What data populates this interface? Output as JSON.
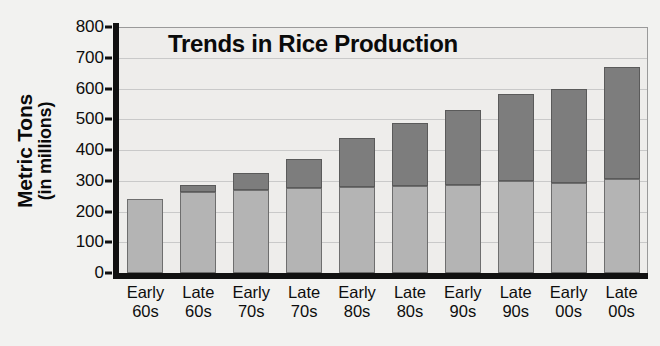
{
  "chart_data": {
    "type": "bar",
    "stacked": true,
    "title": "Trends in Rice Production",
    "xlabel": "",
    "ylabel": "Metric Tons (in millions)",
    "ylabel_line1": "Metric Tons",
    "ylabel_line2": "(in millions)",
    "ylim": [
      0,
      800
    ],
    "ytick_step": 100,
    "yticks": [
      800,
      700,
      600,
      500,
      400,
      300,
      200,
      100,
      0
    ],
    "grid": true,
    "legend": "none",
    "categories": [
      "Early 60s",
      "Late 60s",
      "Early 70s",
      "Late 70s",
      "Early 80s",
      "Late 80s",
      "Early 90s",
      "Late 90s",
      "Early 00s",
      "Late 00s"
    ],
    "category_lines": [
      [
        "Early",
        "60s"
      ],
      [
        "Late",
        "60s"
      ],
      [
        "Early",
        "70s"
      ],
      [
        "Late",
        "70s"
      ],
      [
        "Early",
        "80s"
      ],
      [
        "Late",
        "80s"
      ],
      [
        "Early",
        "90s"
      ],
      [
        "Late",
        "90s"
      ],
      [
        "Early",
        "00s"
      ],
      [
        "Late",
        "00s"
      ]
    ],
    "series": [
      {
        "name": "lower-segment",
        "color": "#b4b4b4",
        "values": [
          240,
          265,
          270,
          275,
          280,
          282,
          287,
          298,
          292,
          305
        ]
      },
      {
        "name": "upper-segment",
        "color": "#7d7d7d",
        "values": [
          0,
          20,
          55,
          95,
          160,
          205,
          243,
          285,
          308,
          365
        ]
      }
    ],
    "totals": [
      240,
      285,
      325,
      370,
      440,
      487,
      530,
      583,
      600,
      670
    ]
  },
  "colors": {
    "page_background": "#f2f2f0",
    "plot_background": "#eeedeb",
    "axis": "#111111",
    "gridline": "#c9c9c9",
    "bar_low": "#b4b4b4",
    "bar_high": "#7d7d7d",
    "text": "#0a0a0a"
  }
}
